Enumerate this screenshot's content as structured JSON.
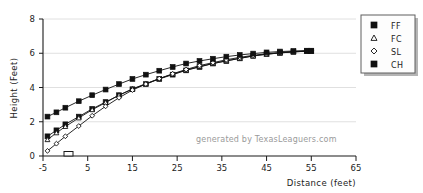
{
  "chart_data": {
    "type": "line",
    "title": "",
    "xlabel": "Distance (feet)",
    "ylabel": "Height (Feet)",
    "xlim": [
      -5,
      65
    ],
    "ylim": [
      0,
      8
    ],
    "xticks": [
      "-5",
      "5",
      "15",
      "25",
      "35",
      "45",
      "55",
      "65"
    ],
    "xtick_values": [
      -5,
      5,
      15,
      25,
      35,
      45,
      55,
      65
    ],
    "yticks": [
      "0",
      "2",
      "4",
      "6",
      "8"
    ],
    "ytick_values": [
      0,
      2,
      4,
      6,
      8
    ],
    "grid": "horizontal",
    "legend_position": "right",
    "annotation": "generated by TexasLeaguers.com",
    "series": [
      {
        "name": "FF",
        "marker": "filled-square",
        "x": [
          -4,
          -2,
          0,
          3,
          6,
          9,
          12,
          15,
          18,
          21,
          24,
          27,
          30,
          33,
          36,
          39,
          42,
          45,
          48,
          51,
          54,
          55
        ],
        "y": [
          1.15,
          1.5,
          1.85,
          2.3,
          2.75,
          3.15,
          3.55,
          3.9,
          4.2,
          4.5,
          4.75,
          5.0,
          5.2,
          5.4,
          5.55,
          5.7,
          5.85,
          5.95,
          6.02,
          6.08,
          6.12,
          6.12
        ]
      },
      {
        "name": "FC",
        "marker": "triangle",
        "x": [
          -4,
          -2,
          0,
          3,
          6,
          9,
          12,
          15,
          18,
          21,
          24,
          27,
          30,
          33,
          36,
          39,
          42,
          45,
          48,
          51,
          54,
          55
        ],
        "y": [
          0.95,
          1.35,
          1.72,
          2.22,
          2.7,
          3.12,
          3.55,
          3.92,
          4.22,
          4.52,
          4.78,
          5.02,
          5.22,
          5.4,
          5.56,
          5.7,
          5.84,
          5.94,
          6.02,
          6.08,
          6.12,
          6.12
        ]
      },
      {
        "name": "SL",
        "marker": "diamond",
        "x": [
          -4,
          -2,
          0,
          3,
          6,
          9,
          12,
          15,
          18,
          21,
          24,
          27,
          30,
          33,
          36,
          39,
          42,
          45,
          48,
          51,
          54,
          55
        ],
        "y": [
          0.3,
          0.72,
          1.15,
          1.75,
          2.35,
          2.9,
          3.4,
          3.85,
          4.2,
          4.52,
          4.8,
          5.05,
          5.28,
          5.45,
          5.62,
          5.76,
          5.88,
          5.97,
          6.04,
          6.1,
          6.14,
          6.14
        ]
      },
      {
        "name": "CH",
        "marker": "filled-square",
        "x": [
          -4,
          -2,
          0,
          3,
          6,
          9,
          12,
          15,
          18,
          21,
          24,
          27,
          30,
          33,
          36,
          39,
          42,
          45,
          48,
          51,
          54,
          55
        ],
        "y": [
          2.3,
          2.55,
          2.82,
          3.2,
          3.55,
          3.88,
          4.2,
          4.5,
          4.75,
          4.98,
          5.2,
          5.4,
          5.55,
          5.68,
          5.8,
          5.9,
          5.98,
          6.05,
          6.1,
          6.13,
          6.15,
          6.15
        ]
      }
    ],
    "home_plate_marker": {
      "x": 0,
      "y": 0,
      "label": "home-plate"
    }
  },
  "legend": {
    "entries": [
      {
        "label": "FF",
        "marker": "filled-square"
      },
      {
        "label": "FC",
        "marker": "triangle"
      },
      {
        "label": "SL",
        "marker": "diamond"
      },
      {
        "label": "CH",
        "marker": "filled-square"
      }
    ]
  },
  "colors": {
    "line": "#111111",
    "grid": "#d8d8d8",
    "axis": "#1a1a1a",
    "watermark": "#9a9a9a",
    "background": "#ffffff"
  }
}
